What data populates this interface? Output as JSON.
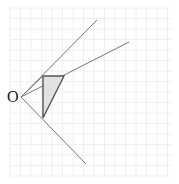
{
  "diagram": {
    "type": "geometry-rays-on-grid",
    "grid": {
      "x0": 10,
      "y0": 8,
      "x1": 172,
      "y1": 176,
      "step": 10.5,
      "color": "#ececec"
    },
    "origin": {
      "label": "O",
      "x": 21,
      "y": 97
    },
    "rays": [
      {
        "name": "ray-upper",
        "x2": 97,
        "y2": 20
      },
      {
        "name": "ray-middle",
        "x2": 129,
        "y2": 42
      },
      {
        "name": "ray-lower",
        "x2": 86,
        "y2": 164
      }
    ],
    "triangle": {
      "points": [
        [
          43,
          76
        ],
        [
          64,
          76
        ],
        [
          43,
          118
        ]
      ],
      "fill": "#e2e2e2",
      "stroke": "#555555"
    },
    "line_color": "#777777"
  }
}
